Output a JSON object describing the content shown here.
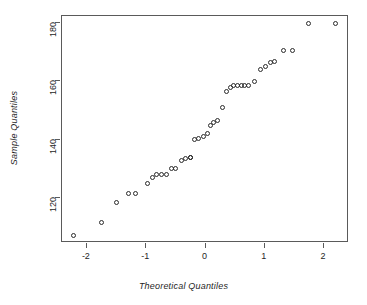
{
  "chart_data": {
    "type": "scatter",
    "title": "",
    "xlabel": "Theoretical Quantiles",
    "ylabel": "Sample Quantiles",
    "xlim": [
      -2.42,
      2.42
    ],
    "ylim": [
      104.5,
      182.5
    ],
    "grid": false,
    "legend": null,
    "marker": "open-circle",
    "marker_color": "#2b2b2b",
    "xticks": [
      -2,
      -1,
      0,
      1,
      2
    ],
    "xticklabels": [
      "-2",
      "-1",
      "0",
      "1",
      "2"
    ],
    "yticks": [
      120,
      140,
      160,
      180
    ],
    "yticklabels": [
      "120",
      "140",
      "160",
      "180"
    ],
    "n_points": 40,
    "points": [
      {
        "x": -2.23,
        "y": 107.0
      },
      {
        "x": -1.75,
        "y": 111.5
      },
      {
        "x": -1.5,
        "y": 118.5
      },
      {
        "x": -1.3,
        "y": 121.5
      },
      {
        "x": -1.18,
        "y": 121.5
      },
      {
        "x": -0.97,
        "y": 125.0
      },
      {
        "x": -0.9,
        "y": 127.0
      },
      {
        "x": -0.82,
        "y": 128.0
      },
      {
        "x": -0.74,
        "y": 128.0
      },
      {
        "x": -0.66,
        "y": 128.0
      },
      {
        "x": -0.58,
        "y": 130.0
      },
      {
        "x": -0.51,
        "y": 130.0
      },
      {
        "x": -0.4,
        "y": 133.0
      },
      {
        "x": -0.33,
        "y": 133.5
      },
      {
        "x": -0.25,
        "y": 134.0
      },
      {
        "x": -0.18,
        "y": 140.0
      },
      {
        "x": -0.11,
        "y": 140.5
      },
      {
        "x": -0.04,
        "y": 141.0
      },
      {
        "x": 0.03,
        "y": 142.0
      },
      {
        "x": 0.09,
        "y": 145.0
      },
      {
        "x": 0.14,
        "y": 146.0
      },
      {
        "x": 0.2,
        "y": 146.5
      },
      {
        "x": 0.28,
        "y": 151.0
      },
      {
        "x": 0.36,
        "y": 156.5
      },
      {
        "x": 0.42,
        "y": 158.0
      },
      {
        "x": 0.48,
        "y": 158.5
      },
      {
        "x": 0.54,
        "y": 158.5
      },
      {
        "x": 0.6,
        "y": 158.5
      },
      {
        "x": 0.66,
        "y": 158.5
      },
      {
        "x": 0.72,
        "y": 158.5
      },
      {
        "x": 0.82,
        "y": 160.0
      },
      {
        "x": 0.92,
        "y": 164.0
      },
      {
        "x": 1.02,
        "y": 165.0
      },
      {
        "x": 1.1,
        "y": 166.5
      },
      {
        "x": 1.16,
        "y": 167.0
      },
      {
        "x": 1.31,
        "y": 170.5
      },
      {
        "x": 1.47,
        "y": 170.5
      },
      {
        "x": 1.74,
        "y": 180.0
      },
      {
        "x": 2.19,
        "y": 180.0
      },
      {
        "x": -0.25,
        "y": 134.0
      }
    ]
  }
}
